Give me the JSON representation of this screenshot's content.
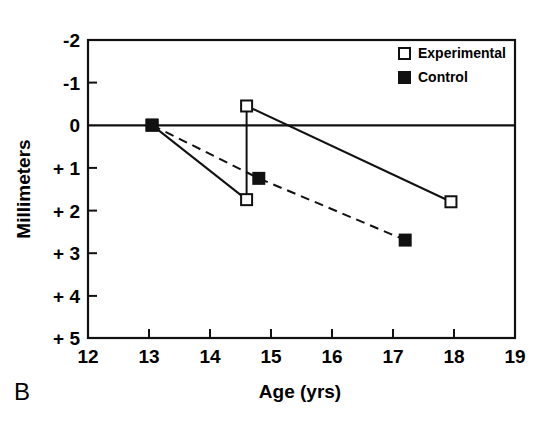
{
  "figure": {
    "panel_label": "B",
    "background_color": "#ffffff",
    "ink_color": "#111111"
  },
  "chart_data": {
    "type": "line",
    "title": "",
    "subtitle": "",
    "xlabel": "Age (yrs)",
    "ylabel": "Millimeters",
    "xlim": [
      12,
      19
    ],
    "ylim": [
      -2,
      5
    ],
    "y_axis_inverted": true,
    "grid": false,
    "zero_line": 0,
    "legend_position": "top-right",
    "xticks": [
      12,
      13,
      14,
      15,
      16,
      17,
      18,
      19
    ],
    "xtick_labels": [
      "12",
      "13",
      "14",
      "15",
      "16",
      "17",
      "18",
      "19"
    ],
    "yticks": [
      -2,
      -1,
      0,
      1,
      2,
      3,
      4,
      5
    ],
    "ytick_labels": [
      "-2",
      "-1",
      "0",
      "+ 1",
      "+ 2",
      "+ 3",
      "+ 4",
      "+ 5"
    ],
    "series": [
      {
        "name": "Experimental",
        "marker": "open-square",
        "linestyle": "solid",
        "color": "#111111",
        "segments": [
          {
            "name": "pre-treatment",
            "x": [
              13.05,
              14.6
            ],
            "y": [
              0.0,
              1.75
            ]
          },
          {
            "name": "vertical-correction",
            "x": [
              14.6,
              14.6
            ],
            "y": [
              1.75,
              -0.45
            ]
          },
          {
            "name": "post-treatment",
            "x": [
              14.6,
              17.95
            ],
            "y": [
              -0.45,
              1.8
            ]
          }
        ],
        "points": [
          {
            "x": 13.05,
            "y": 0.0
          },
          {
            "x": 14.6,
            "y": 1.75
          },
          {
            "x": 14.6,
            "y": -0.45
          },
          {
            "x": 17.95,
            "y": 1.8
          }
        ]
      },
      {
        "name": "Control",
        "marker": "filled-square",
        "linestyle": "dashed",
        "color": "#111111",
        "segments": [
          {
            "name": "control-trend",
            "x": [
              13.05,
              14.8,
              17.2
            ],
            "y": [
              0.0,
              1.25,
              2.7
            ]
          }
        ],
        "points": [
          {
            "x": 13.05,
            "y": 0.0
          },
          {
            "x": 14.8,
            "y": 1.25
          },
          {
            "x": 17.2,
            "y": 2.7
          }
        ]
      }
    ],
    "legend": [
      {
        "label": "Experimental",
        "marker": "open-square"
      },
      {
        "label": "Control",
        "marker": "filled-square"
      }
    ]
  }
}
